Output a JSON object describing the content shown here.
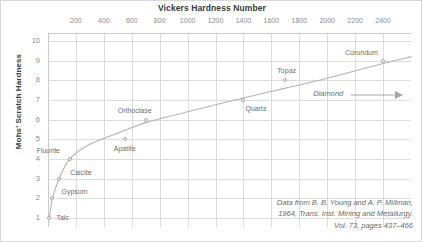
{
  "chart_data": {
    "type": "scatter",
    "title": "Vickers Hardness Number",
    "xlabel": "Vickers Hardness Number",
    "ylabel": "Mohs' Scratch Hardness",
    "xlim": [
      0,
      2600
    ],
    "ylim": [
      0.55,
      10.4
    ],
    "grid": true,
    "legend": "none",
    "xticks": [
      200,
      400,
      600,
      800,
      1000,
      1200,
      1400,
      1600,
      1800,
      2000,
      2200,
      2400
    ],
    "yticks": [
      1,
      2,
      3,
      4,
      5,
      6,
      7,
      8,
      9,
      10
    ],
    "x_axis_position": "top",
    "points": [
      {
        "label": "Talc",
        "x": 10,
        "y": 1,
        "label_dx": 7,
        "label_dy": -4
      },
      {
        "label": "Gypsum",
        "x": 32,
        "y": 2,
        "label_dx": 9,
        "label_dy": -10
      },
      {
        "label": "Calcite",
        "x": 80,
        "y": 3,
        "label_dx": 11,
        "label_dy": -10
      },
      {
        "label": "Fluorite",
        "x": 155,
        "y": 4,
        "label_dx": -33,
        "label_dy": -12
      },
      {
        "label": "Apatite",
        "x": 550,
        "y": 5,
        "label_dx": -11,
        "label_dy": 6
      },
      {
        "label": "Orthoclase",
        "x": 700,
        "y": 6,
        "label_dx": -28,
        "label_dy": -13
      },
      {
        "label": "Quartz",
        "x": 1400,
        "y": 7,
        "label_dx": 2,
        "label_dy": 5
      },
      {
        "label": "Topaz",
        "x": 1700,
        "y": 8,
        "label_dx": -8,
        "label_dy": -13
      },
      {
        "label": "Corundum",
        "x": 2400,
        "y": 9,
        "label_dx": -38,
        "label_dy": -12
      }
    ],
    "curve": [
      {
        "x": 10,
        "y": 1.0
      },
      {
        "x": 32,
        "y": 2.0
      },
      {
        "x": 80,
        "y": 3.0
      },
      {
        "x": 155,
        "y": 4.0
      },
      {
        "x": 300,
        "y": 4.75
      },
      {
        "x": 550,
        "y": 5.45
      },
      {
        "x": 700,
        "y": 5.85
      },
      {
        "x": 1000,
        "y": 6.4
      },
      {
        "x": 1400,
        "y": 7.1
      },
      {
        "x": 1700,
        "y": 7.6
      },
      {
        "x": 2000,
        "y": 8.1
      },
      {
        "x": 2400,
        "y": 8.85
      },
      {
        "x": 2600,
        "y": 9.2
      }
    ],
    "annotations": [
      {
        "name": "diamond",
        "text": "Diamond",
        "x": 1900,
        "y": 7.55,
        "arrow": true
      }
    ],
    "source_note": [
      "Data from B. B. Young and A. P. Millman,",
      "1964, Trans. Inst. Mining and Metallurgy.",
      "Vol. 73, pages 437–466"
    ],
    "colors": {
      "grid": "#dcdcdc",
      "axis": "#c9c9c9",
      "curve": "#b3b3b3",
      "marker_edge": "#a6a6a6",
      "tick_text": "#8a8a8a",
      "label_text": "#6e6e6e",
      "title_text": "#3a3a3a",
      "background": "#ffffff"
    }
  }
}
